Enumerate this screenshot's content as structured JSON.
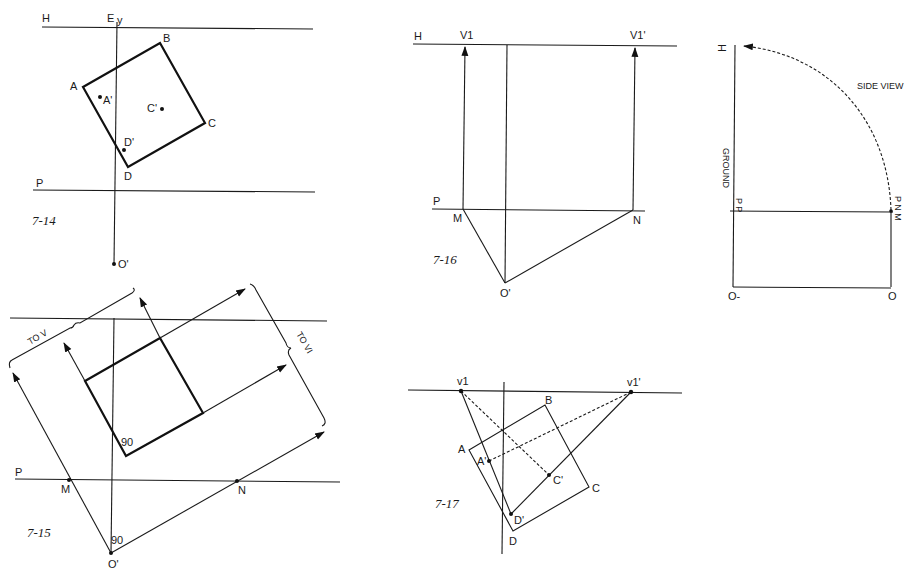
{
  "figures": {
    "fig_7_14": {
      "caption": "7-14",
      "labels": {
        "H": "H",
        "E": "E",
        "y": "y",
        "A": "A",
        "B": "B",
        "C": "C",
        "D": "D",
        "A_prime": "A'",
        "C_prime": "C'",
        "D_prime": "D'",
        "P": "P",
        "O_prime": "O'"
      }
    },
    "fig_7_15": {
      "caption": "7-15",
      "labels": {
        "to_v": "TO V",
        "to_v1": "TO VI",
        "P": "P",
        "M": "M",
        "N": "N",
        "angle_square": "90",
        "angle_origin": "90",
        "O_prime": "O'"
      }
    },
    "fig_7_16": {
      "caption": "7-16",
      "labels": {
        "H": "H",
        "V1": "V1",
        "V1_prime": "V1'",
        "P": "P",
        "M": "M",
        "N": "N",
        "O_prime": "O'"
      }
    },
    "side_view": {
      "labels": {
        "H": "H",
        "title": "SIDE VIEW",
        "ground": "GROUND",
        "PP": "P P",
        "PNM": "P N M",
        "O_left": "O-",
        "O_right": "O"
      }
    },
    "fig_7_17": {
      "caption": "7-17",
      "labels": {
        "v1": "v1",
        "v1_prime": "v1'",
        "A": "A",
        "B": "B",
        "C": "C",
        "D": "D",
        "A_prime": "A'",
        "C_prime": "C'",
        "D_prime": "D'"
      }
    }
  }
}
